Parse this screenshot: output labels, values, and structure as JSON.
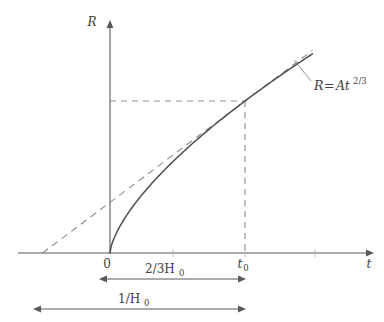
{
  "figure": {
    "axes": {
      "x_label": "t",
      "y_label": "R",
      "origin_label": "0",
      "t0_label_base": "t",
      "t0_label_sub": "0"
    },
    "annotations": {
      "curve_equation_lhs": "R",
      "curve_equation_eq": "=",
      "curve_equation_coeff": "At",
      "curve_equation_exponent": "2/3",
      "curve_equation_full": "R = At^{2/3}"
    },
    "dimensions": [
      {
        "name": "two-thirds-hubble-time",
        "label_main": "2/3H",
        "label_sub": "0",
        "label_full": "2/3H_0"
      },
      {
        "name": "hubble-time",
        "label_main": "1/H",
        "label_sub": "0",
        "label_full": "1/H_0"
      }
    ],
    "colors": {
      "curve": "#4d4e51",
      "dashed": "#8d8e91",
      "axis": "#58595b",
      "text": "#3f4042",
      "background": "#ffffff"
    }
  },
  "chart_data": {
    "type": "line",
    "title": "",
    "xlabel": "t",
    "ylabel": "R",
    "grid": false,
    "legend": "none",
    "axis_origin_px": [
      110,
      253
    ],
    "xlim_px": [
      110,
      372
    ],
    "ylim_px": [
      253,
      30
    ],
    "series": [
      {
        "name": "R = At^{2/3}",
        "style": "solid",
        "description": "Scale factor for matter-dominated universe, R proportional to t^(2/3)",
        "x": [
          0,
          0.05,
          0.1,
          0.2,
          0.3,
          0.4,
          0.5,
          0.6,
          0.7,
          0.8,
          0.9,
          1.0,
          1.1,
          1.2,
          1.3,
          1.4,
          1.5
        ],
        "y": [
          0,
          0.136,
          0.215,
          0.342,
          0.448,
          0.543,
          0.63,
          0.711,
          0.788,
          0.862,
          0.932,
          1.0,
          1.066,
          1.129,
          1.191,
          1.251,
          1.31
        ]
      },
      {
        "name": "tangent at t0",
        "style": "dashed",
        "description": "Tangent line to the curve at t = t_0, extrapolating back to the time axis at t = t_0 - 1/H_0",
        "x": [
          -0.5,
          0,
          0.5,
          1.0,
          1.5
        ],
        "y": [
          0,
          0.333,
          0.667,
          1.0,
          1.333
        ]
      }
    ],
    "markers": [
      {
        "name": "t0-point",
        "x": 1.0,
        "y": 1.0,
        "x_tick_label": "t_0",
        "guides": [
          "vertical-dashed-to-x-axis",
          "horizontal-dashed-to-y-axis"
        ]
      }
    ],
    "annotations": [
      {
        "name": "curve-equation",
        "text": "R = At^{2/3}",
        "points_to_x": 1.28,
        "points_to_y": 1.17
      },
      {
        "name": "two-thirds-hubble-span",
        "text": "2/3H_0",
        "from_x": 0,
        "to_x": 1.0,
        "meaning": "interval from 0 to t_0 equals 2/(3H_0)"
      },
      {
        "name": "hubble-time-span",
        "text": "1/H_0",
        "from_x": -0.5,
        "to_x": 1.0,
        "meaning": "interval from tangent x-intercept to t_0 equals 1/H_0"
      }
    ]
  }
}
